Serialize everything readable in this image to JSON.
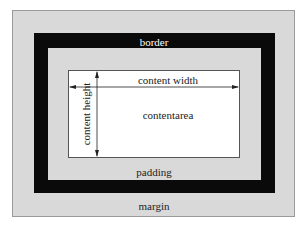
{
  "diagram": {
    "labels": {
      "border": "border",
      "padding": "padding",
      "margin": "margin",
      "content_width": "content width",
      "content_height": "content height",
      "content_area": "contentarea"
    },
    "colors": {
      "margin": "#d9d9d9",
      "border": "#0a0a0a",
      "padding": "#d9d9d9",
      "content": "#ffffff",
      "text": "#222222",
      "border_text": "#ffffff"
    },
    "layers": [
      "margin",
      "border",
      "padding",
      "content"
    ]
  }
}
